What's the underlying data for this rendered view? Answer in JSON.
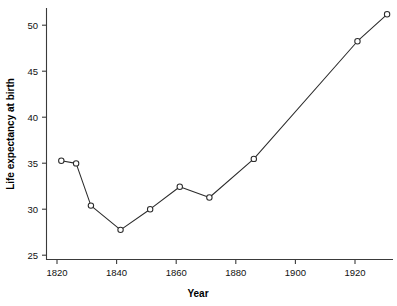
{
  "chart_data": {
    "type": "line",
    "title": "",
    "xlabel": "Year",
    "ylabel": "Life expectancy at birth",
    "x": [
      1820,
      1825,
      1830,
      1840,
      1850,
      1860,
      1870,
      1885,
      1920,
      1930
    ],
    "values": [
      35.0,
      34.7,
      30.0,
      27.3,
      29.6,
      32.1,
      30.9,
      35.2,
      48.3,
      51.3
    ],
    "series": [
      {
        "name": "Life expectancy at birth",
        "x": [
          1820,
          1825,
          1830,
          1840,
          1850,
          1860,
          1870,
          1885,
          1920,
          1930
        ],
        "values": [
          35.0,
          34.7,
          30.0,
          27.3,
          29.6,
          32.1,
          30.9,
          35.2,
          48.3,
          51.3
        ]
      }
    ],
    "xlim": [
      1815,
      1932
    ],
    "ylim": [
      24.0,
      52.0
    ],
    "xticks": [
      1820,
      1840,
      1860,
      1880,
      1900,
      1920
    ],
    "xtick_labels": [
      "1820",
      "1840",
      "1860",
      "1880",
      "1900",
      "1920"
    ],
    "yticks": [
      25,
      30,
      35,
      40,
      45,
      50
    ],
    "ytick_labels": [
      "25",
      "30",
      "35",
      "40",
      "45",
      "50"
    ],
    "grid": false,
    "legend": null,
    "marker": "open-circle",
    "line_color": "#2b2b2b",
    "marker_face_color": "#ffffff",
    "background_color": "#ffffff",
    "annotations": []
  },
  "axes": {
    "x_title": "Year",
    "y_title": "Life expectancy at birth"
  }
}
